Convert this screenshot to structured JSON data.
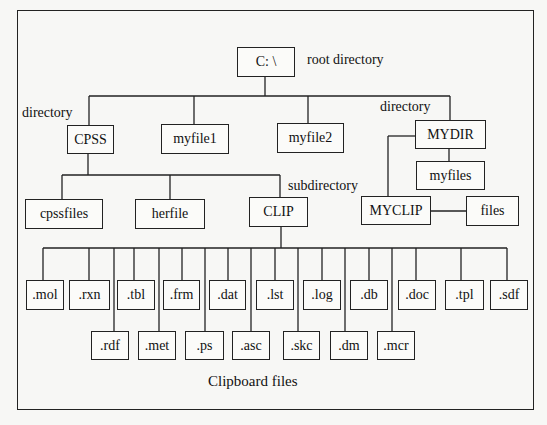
{
  "diagram": {
    "caption": "Clipboard files",
    "labels": {
      "root": "root directory",
      "directory_left": "directory",
      "directory_right": "directory",
      "subdirectory": "subdirectory"
    },
    "nodes": {
      "root": "C:  \\",
      "cpss": "CPSS",
      "myfile1": "myfile1",
      "myfile2": "myfile2",
      "mydir": "MYDIR",
      "myfiles": "myfiles",
      "cpssfiles": "cpssfiles",
      "herfile": "herfile",
      "clip": "CLIP",
      "myclip": "MYCLIP",
      "files": "files"
    },
    "clipboard_top_row": [
      ".mol",
      ".rxn",
      ".tbl",
      ".frm",
      ".dat",
      ".lst",
      ".log",
      ".db",
      ".doc",
      ".tpl",
      ".sdf"
    ],
    "clipboard_bottom_row": [
      ".rdf",
      ".met",
      ".ps",
      ".asc",
      ".skc",
      ".dm",
      ".mcr"
    ]
  }
}
